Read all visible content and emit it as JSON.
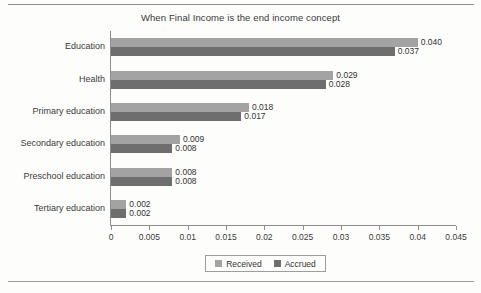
{
  "chart_data": {
    "type": "bar",
    "orientation": "horizontal",
    "title": "When Final Income is the end income concept",
    "xlabel": "",
    "ylabel": "",
    "xlim": [
      0,
      0.045
    ],
    "grid": false,
    "legend_position": "bottom",
    "categories": [
      "Education",
      "Health",
      "Primary education",
      "Secondary education",
      "Preschool education",
      "Tertiary education"
    ],
    "xticks": [
      "0",
      "0.005",
      "0.01",
      "0.015",
      "0.02",
      "0.025",
      "0.03",
      "0.035",
      "0.04",
      "0.045"
    ],
    "xtick_values": [
      0,
      0.005,
      0.01,
      0.015,
      0.02,
      0.025,
      0.03,
      0.035,
      0.04,
      0.045
    ],
    "series": [
      {
        "name": "Received",
        "color": "#a3a3a3",
        "values": [
          0.04,
          0.029,
          0.018,
          0.009,
          0.008,
          0.002
        ],
        "labels": [
          "0.040",
          "0.029",
          "0.018",
          "0.009",
          "0.008",
          "0.002"
        ]
      },
      {
        "name": "Accrued",
        "color": "#6e6e6e",
        "values": [
          0.037,
          0.028,
          0.017,
          0.008,
          0.008,
          0.002
        ],
        "labels": [
          "0.037",
          "0.028",
          "0.017",
          "0.008",
          "0.008",
          "0.002"
        ]
      }
    ]
  },
  "legend": {
    "entries": [
      {
        "label": "Received"
      },
      {
        "label": "Accrued"
      }
    ]
  }
}
